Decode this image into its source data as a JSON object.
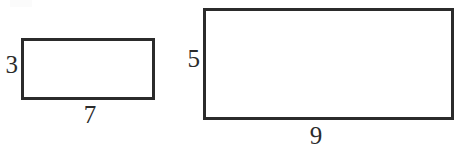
{
  "figure": {
    "background_color": "#ffffff",
    "stroke_color": "#2b2b2b",
    "label_color": "#2b2b2b",
    "width": 460,
    "height": 149
  },
  "shapes": [
    {
      "name": "small-rectangle",
      "type": "rectangle",
      "x": 21,
      "y": 38,
      "width": 134,
      "height": 62,
      "stroke_width": 3,
      "stroke_color": "#2b2b2b",
      "fill": "#ffffff",
      "height_label": {
        "text": "3",
        "position": "left",
        "x": 1,
        "y": 52,
        "font_size": 25
      },
      "width_label": {
        "text": "7",
        "position": "bottom",
        "x": 76,
        "y": 102,
        "font_size": 25
      }
    },
    {
      "name": "large-rectangle",
      "type": "rectangle",
      "x": 203,
      "y": 8,
      "width": 251,
      "height": 112,
      "stroke_width": 3,
      "stroke_color": "#2b2b2b",
      "fill": "#ffffff",
      "height_label": {
        "text": "5",
        "position": "left",
        "x": 182,
        "y": 46,
        "font_size": 25
      },
      "width_label": {
        "text": "9",
        "position": "bottom",
        "x": 302,
        "y": 123,
        "font_size": 25
      }
    }
  ]
}
